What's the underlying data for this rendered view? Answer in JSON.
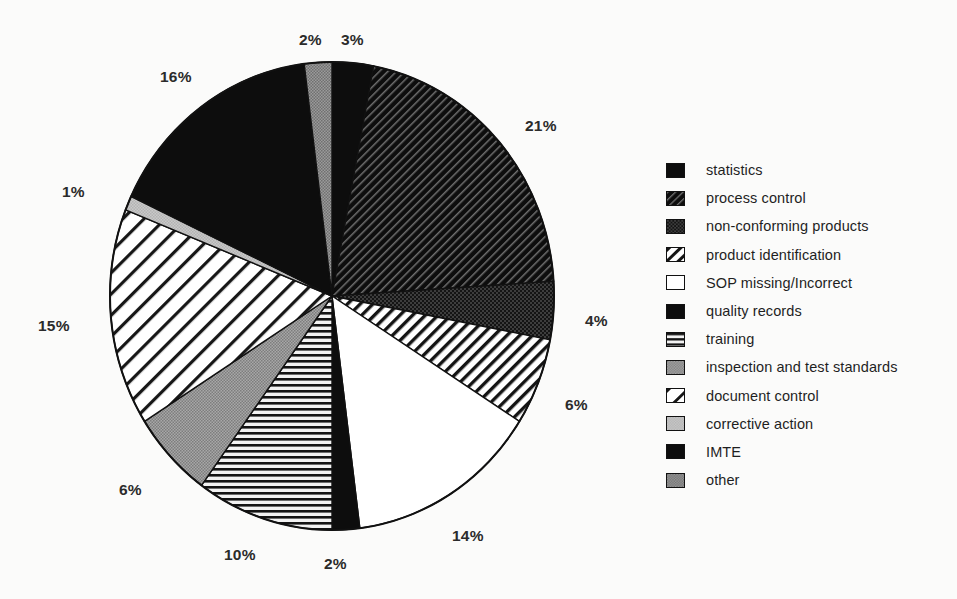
{
  "chart_data": {
    "type": "pie",
    "title": "",
    "subtitle": "",
    "xlabel": "",
    "ylabel": "",
    "units": "percent",
    "legend_position": "right",
    "grid": false,
    "start_angle_deg": 0,
    "direction": "clockwise",
    "categories": [
      "statistics",
      "process control",
      "non-conforming products",
      "product identification",
      "SOP missing/Incorrect",
      "quality records",
      "training",
      "inspection and test standards",
      "document control",
      "corrective action",
      "IMTE",
      "other"
    ],
    "values": [
      3,
      21,
      4,
      6,
      14,
      2,
      10,
      6,
      15,
      1,
      16,
      2
    ],
    "value_labels": [
      "3%",
      "21%",
      "4%",
      "6%",
      "14%",
      "2%",
      "10%",
      "6%",
      "15%",
      "1%",
      "16%",
      "2%"
    ],
    "slices": [
      {
        "label": "statistics",
        "value": 3,
        "display": "3%",
        "pattern": "solid-black",
        "label_x": 341,
        "label_y": 31
      },
      {
        "label": "process control",
        "value": 21,
        "display": "21%",
        "pattern": "dark-diagonal",
        "label_x": 525,
        "label_y": 117
      },
      {
        "label": "non-conforming products",
        "value": 4,
        "display": "4%",
        "pattern": "dark-checker",
        "label_x": 585,
        "label_y": 312
      },
      {
        "label": "product identification",
        "value": 6,
        "display": "6%",
        "pattern": "white-diagonal-med",
        "label_x": 565,
        "label_y": 396
      },
      {
        "label": "SOP missing/Incorrect",
        "value": 14,
        "display": "14%",
        "pattern": "white",
        "label_x": 452,
        "label_y": 527
      },
      {
        "label": "quality records",
        "value": 2,
        "display": "2%",
        "pattern": "solid-black",
        "label_x": 324,
        "label_y": 555
      },
      {
        "label": "training",
        "value": 10,
        "display": "10%",
        "pattern": "horizontal-lines",
        "label_x": 224,
        "label_y": 546
      },
      {
        "label": "inspection and test standards",
        "value": 6,
        "display": "6%",
        "pattern": "gray-checker",
        "label_x": 119,
        "label_y": 481
      },
      {
        "label": "document control",
        "value": 15,
        "display": "15%",
        "pattern": "white-diagonal-wide",
        "label_x": 38,
        "label_y": 317
      },
      {
        "label": "corrective action",
        "value": 1,
        "display": "1%",
        "pattern": "light-gray",
        "label_x": 62,
        "label_y": 183
      },
      {
        "label": "IMTE",
        "value": 16,
        "display": "16%",
        "pattern": "solid-black",
        "label_x": 160,
        "label_y": 68
      },
      {
        "label": "other",
        "value": 2,
        "display": "2%",
        "pattern": "gray-stipple",
        "label_x": 299,
        "label_y": 31
      }
    ],
    "total": 100
  },
  "legend": {
    "items": [
      {
        "label": "statistics",
        "pattern": "solid-black"
      },
      {
        "label": "process control",
        "pattern": "dark-diagonal"
      },
      {
        "label": "non-conforming products",
        "pattern": "dark-checker"
      },
      {
        "label": "product identification",
        "pattern": "white-diagonal-med"
      },
      {
        "label": "SOP missing/Incorrect",
        "pattern": "white"
      },
      {
        "label": "quality records",
        "pattern": "solid-black"
      },
      {
        "label": "training",
        "pattern": "horizontal-lines"
      },
      {
        "label": "inspection and test standards",
        "pattern": "gray-checker"
      },
      {
        "label": "document control",
        "pattern": "white-diagonal-wide"
      },
      {
        "label": "corrective action",
        "pattern": "light-gray"
      },
      {
        "label": "IMTE",
        "pattern": "solid-black"
      },
      {
        "label": "other",
        "pattern": "gray-stipple"
      }
    ]
  },
  "colors": {
    "background": "#fbfbfa",
    "ink": "#111111",
    "label_text": "#2b2b2b",
    "legend_text": "#1f1f1f",
    "gray_mid": "#9a9a9a",
    "gray_light": "#cccccc",
    "gray_dark": "#4a4a4a"
  },
  "geometry": {
    "center_x": 332,
    "center_y": 296,
    "radius_x": 222,
    "radius_y": 234
  }
}
